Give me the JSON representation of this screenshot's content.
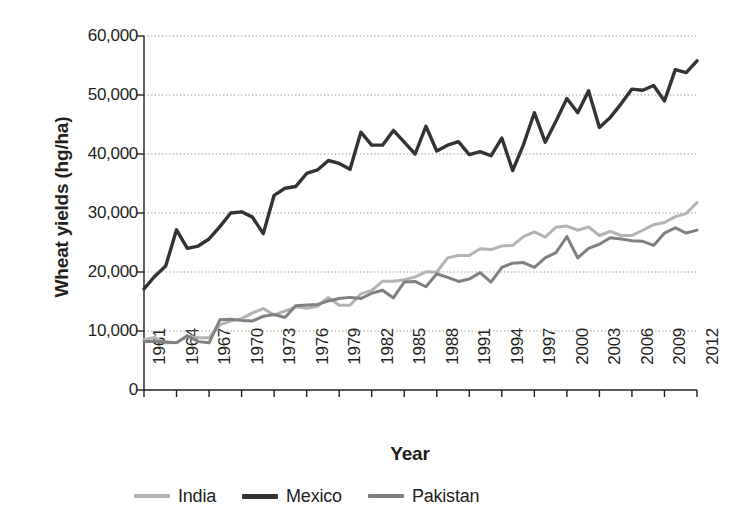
{
  "chart_data": {
    "type": "line",
    "title": "",
    "xlabel": "Year",
    "ylabel": "Wheat yields (hg/ha)",
    "xlim": [
      1961,
      2012
    ],
    "ylim": [
      0,
      60000
    ],
    "grid": "horizontal-dotted",
    "legend_position": "bottom",
    "y_ticks": [
      0,
      10000,
      20000,
      30000,
      40000,
      50000,
      60000
    ],
    "y_tick_labels": [
      "0",
      "10,000",
      "20,000",
      "30,000",
      "40,000",
      "50,000",
      "60,000"
    ],
    "x_ticks": [
      1961,
      1964,
      1967,
      1970,
      1973,
      1976,
      1979,
      1982,
      1985,
      1988,
      1991,
      1994,
      1997,
      2000,
      2003,
      2006,
      2009,
      2012
    ],
    "x_tick_labels": [
      "1961",
      "1964",
      "1967",
      "1970",
      "1973",
      "1976",
      "1979",
      "1982",
      "1985",
      "1988",
      "1991",
      "1994",
      "1997",
      "2000",
      "2003",
      "2006",
      "2009",
      "2012"
    ],
    "x": [
      1961,
      1962,
      1963,
      1964,
      1965,
      1966,
      1967,
      1968,
      1969,
      1970,
      1971,
      1972,
      1973,
      1974,
      1975,
      1976,
      1977,
      1978,
      1979,
      1980,
      1981,
      1982,
      1983,
      1984,
      1985,
      1986,
      1987,
      1988,
      1989,
      1990,
      1991,
      1992,
      1993,
      1994,
      1995,
      1996,
      1997,
      1998,
      1999,
      2000,
      2001,
      2002,
      2003,
      2004,
      2005,
      2006,
      2007,
      2008,
      2009,
      2010,
      2011,
      2012
    ],
    "series": [
      {
        "name": "India",
        "color": "#b3b3b3",
        "values": [
          8510,
          8900,
          8000,
          8060,
          9130,
          8870,
          8870,
          11030,
          11690,
          12090,
          13070,
          13800,
          12710,
          13380,
          14100,
          13870,
          14200,
          15680,
          14360,
          14360,
          16300,
          16890,
          18430,
          18430,
          18700,
          19160,
          20030,
          20000,
          22400,
          22810,
          22810,
          23950,
          23800,
          24400,
          24500,
          26000,
          26800,
          25900,
          27600,
          27780,
          27080,
          27620,
          26190,
          26880,
          26190,
          26190,
          27080,
          28020,
          28390,
          29380,
          29890,
          31770
        ]
      },
      {
        "name": "Mexico",
        "color": "#333333",
        "values": [
          17120,
          19300,
          21000,
          27150,
          24000,
          24400,
          25600,
          27700,
          30000,
          30200,
          29300,
          26500,
          33000,
          34200,
          34500,
          36700,
          37300,
          38900,
          38400,
          37400,
          43700,
          41500,
          41500,
          44000,
          42000,
          40000,
          44700,
          40500,
          41500,
          42100,
          39900,
          40400,
          39700,
          42700,
          37200,
          41600,
          47000,
          42000,
          45600,
          49400,
          47000,
          50700,
          44500,
          46200,
          48500,
          51000,
          50800,
          51600,
          49000,
          54300,
          53800,
          55800
        ]
      },
      {
        "name": "Pakistan",
        "color": "#808080",
        "values": [
          8230,
          8200,
          8150,
          8000,
          9200,
          8200,
          8000,
          11900,
          12000,
          11800,
          11700,
          12500,
          12800,
          12300,
          14300,
          14400,
          14500,
          15100,
          15500,
          15700,
          15500,
          16400,
          16900,
          15600,
          18300,
          18400,
          17500,
          19700,
          19100,
          18400,
          18800,
          19900,
          18300,
          20800,
          21500,
          21600,
          20800,
          22400,
          23300,
          26000,
          22400,
          24000,
          24700,
          25800,
          25600,
          25300,
          25200,
          24500,
          26600,
          27500,
          26600,
          27100
        ]
      }
    ]
  },
  "legend": {
    "items": [
      {
        "label": "India",
        "color": "#b3b3b3"
      },
      {
        "label": "Mexico",
        "color": "#333333"
      },
      {
        "label": "Pakistan",
        "color": "#808080"
      }
    ]
  }
}
